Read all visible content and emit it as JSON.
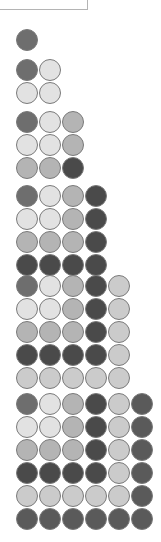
{
  "legend_box": {
    "visible": true
  },
  "colors": {
    "D": "#6e6e6e",
    "L": "#e2e2e2",
    "M": "#b4b4b4",
    "VD": "#4a4a4a",
    "S": "#cbcbcb",
    "X": "#5a5a5a"
  },
  "blocks": [
    {
      "n": 1,
      "top": 28,
      "rows": [
        [
          "D"
        ]
      ]
    },
    {
      "n": 2,
      "top": 58,
      "rows": [
        [
          "D",
          "L"
        ],
        [
          "L",
          "L"
        ]
      ]
    },
    {
      "n": 3,
      "top": 110,
      "rows": [
        [
          "D",
          "L",
          "M"
        ],
        [
          "L",
          "L",
          "M"
        ],
        [
          "M",
          "M",
          "VD"
        ]
      ]
    },
    {
      "n": 4,
      "top": 184,
      "rows": [
        [
          "D",
          "L",
          "M",
          "VD"
        ],
        [
          "L",
          "L",
          "M",
          "VD"
        ],
        [
          "M",
          "M",
          "M",
          "VD"
        ],
        [
          "VD",
          "VD",
          "VD",
          "VD"
        ]
      ]
    },
    {
      "n": 5,
      "top": 274,
      "rows": [
        [
          "D",
          "L",
          "M",
          "VD",
          "S"
        ],
        [
          "L",
          "L",
          "M",
          "VD",
          "S"
        ],
        [
          "M",
          "M",
          "M",
          "VD",
          "S"
        ],
        [
          "VD",
          "VD",
          "VD",
          "VD",
          "S"
        ],
        [
          "S",
          "S",
          "S",
          "S",
          "S"
        ]
      ]
    },
    {
      "n": 6,
      "top": 392,
      "rows": [
        [
          "D",
          "L",
          "M",
          "VD",
          "S",
          "X"
        ],
        [
          "L",
          "L",
          "M",
          "VD",
          "S",
          "X"
        ],
        [
          "M",
          "M",
          "M",
          "VD",
          "S",
          "X"
        ],
        [
          "VD",
          "VD",
          "VD",
          "VD",
          "S",
          "X"
        ],
        [
          "S",
          "S",
          "S",
          "S",
          "S",
          "X"
        ],
        [
          "X",
          "X",
          "X",
          "X",
          "X",
          "X"
        ]
      ]
    }
  ]
}
